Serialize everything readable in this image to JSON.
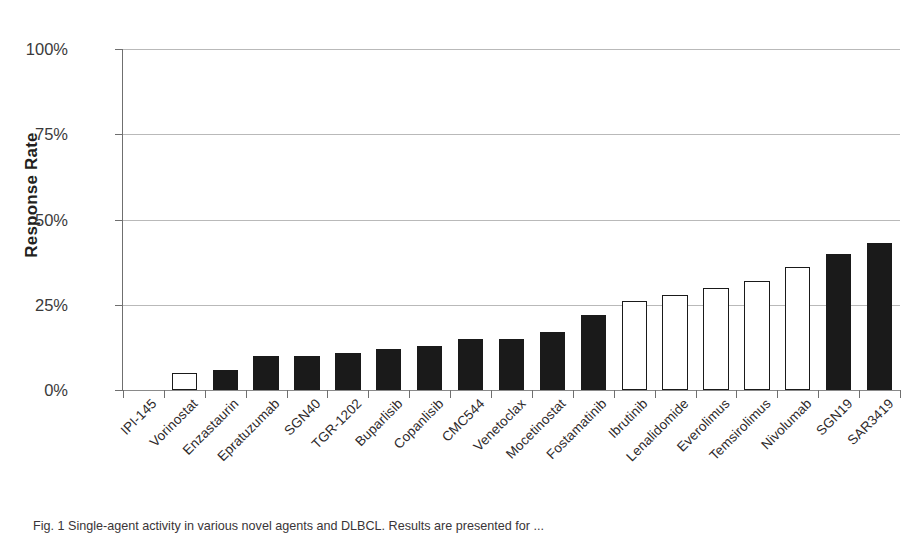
{
  "figure": {
    "caption": "Fig. 1  Single-agent activity in various novel agents and DLBCL. Results are presented for ..."
  },
  "axes": {
    "y_title": "Response Rate",
    "y_ticks": [
      "0%",
      "25%",
      "50%",
      "75%",
      "100%"
    ],
    "y_tick_values": [
      0,
      25,
      50,
      75,
      100
    ]
  },
  "chart_data": {
    "type": "bar",
    "title": "",
    "subtitle": "",
    "xlabel": "",
    "ylabel": "Response Rate",
    "ylim": [
      0,
      100
    ],
    "ytick_labels": [
      "0%",
      "25%",
      "50%",
      "75%",
      "100%"
    ],
    "ytick_values": [
      0,
      25,
      50,
      75,
      100
    ],
    "grid": "horizontal",
    "legend": "none",
    "units": "percent",
    "categories": [
      "IPI-145",
      "Vorinostat",
      "Enzastaurin",
      "Epratuzumab",
      "SGN40",
      "TGR-1202",
      "Buparlisib",
      "Copanlisib",
      "CMC544",
      "Venetoclax",
      "Mocetinostat",
      "Fostamatinib",
      "Ibrutinib",
      "Lenalidomide",
      "Everolimus",
      "Temsirolimus",
      "Nivolumab",
      "SGN19",
      "SAR3419"
    ],
    "values": [
      0,
      5,
      6,
      10,
      10,
      11,
      12,
      13,
      15,
      15,
      17,
      22,
      26,
      28,
      30,
      32,
      36,
      40,
      43
    ],
    "bar_styles": [
      "open",
      "open",
      "filled",
      "filled",
      "filled",
      "filled",
      "filled",
      "filled",
      "filled",
      "filled",
      "filled",
      "filled",
      "open",
      "open",
      "open",
      "open",
      "open",
      "filled",
      "filled"
    ],
    "colors": {
      "filled": "#1a1a1a",
      "open_fill": "#ffffff",
      "open_stroke": "#1a1a1a",
      "gridline": "#b9b9b9",
      "axis": "#6f6f6f",
      "text": "#231f20"
    }
  }
}
